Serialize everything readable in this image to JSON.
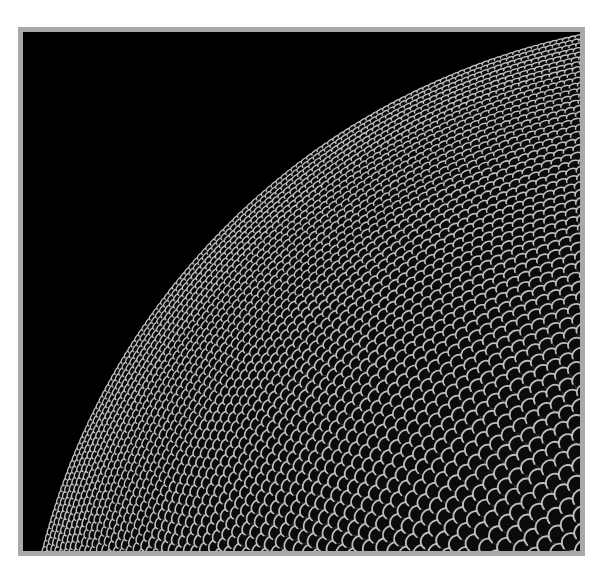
{
  "image": {
    "subject": "compound-eye-micrograph",
    "description": "Scanning electron micrograph of an insect compound eye showing a dome of ommatidia facets against a black background",
    "colors": {
      "page_background": "#ffffff",
      "frame": "#a9a9a9",
      "background": "#000000",
      "facet_fill": "#0b0b0b",
      "facet_rim": "#d8d8d8",
      "facet_shadow": "#3a3a3a"
    },
    "dome": {
      "center_x": 700,
      "center_y": 690,
      "radius": 700,
      "facet_size_near_edge": 7,
      "facet_size_center": 17
    }
  }
}
